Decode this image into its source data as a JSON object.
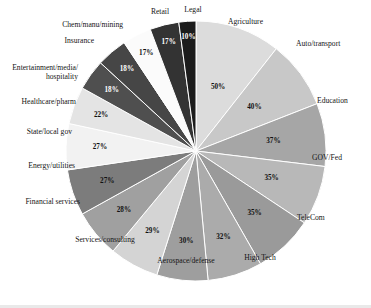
{
  "chart_data": {
    "type": "pie",
    "title": "",
    "subtitle": "",
    "xlabel": "",
    "ylabel": "",
    "legend_position": "none",
    "grid": false,
    "value_suffix": "%",
    "start_angle_deg": 0,
    "direction": "clockwise",
    "categories": [
      "Agriculture",
      "Auto/transport",
      "Education",
      "GOV/Fed",
      "TeleCom",
      "High Tech",
      "Aerospace/defense",
      "Services/consulting",
      "Financial services",
      "Energy/utilities",
      "State/local gov",
      "Healthcare/pharm",
      "Entertainment/media/ hospitality",
      "Insurance",
      "Chem/manu/mining",
      "Retail",
      "Legal"
    ],
    "values": [
      50,
      40,
      37,
      35,
      35,
      32,
      30,
      29,
      28,
      27,
      27,
      22,
      18,
      18,
      17,
      17,
      10
    ],
    "value_labels": [
      "50%",
      "40%",
      "37%",
      "35%",
      "35%",
      "32%",
      "30%",
      "29%",
      "28%",
      "27%",
      "27%",
      "22%",
      "18%",
      "18%",
      "17%",
      "17%",
      "10%"
    ],
    "colors": [
      "#dcdcdc",
      "#c8c8c8",
      "#a6a6a6",
      "#b8b8b8",
      "#9a9a9a",
      "#ababab",
      "#9e9e9e",
      "#d4d4d4",
      "#a0a0a0",
      "#7c7c7c",
      "#f2f2f2",
      "#e4e4e4",
      "#4f4f4f",
      "#464646",
      "#fbfbfb",
      "#333333",
      "#1c1c1c"
    ],
    "label_text_colors": [
      "dark",
      "dark",
      "dark",
      "dark",
      "dark",
      "dark",
      "dark",
      "dark",
      "dark",
      "dark",
      "dark",
      "dark",
      "light",
      "light",
      "dark",
      "light",
      "light"
    ],
    "slices": [
      {
        "name": "Agriculture",
        "value": 50,
        "label": "50%",
        "color": "#dcdcdc"
      },
      {
        "name": "Auto/transport",
        "value": 40,
        "label": "40%",
        "color": "#c8c8c8"
      },
      {
        "name": "Education",
        "value": 37,
        "label": "37%",
        "color": "#a6a6a6"
      },
      {
        "name": "GOV/Fed",
        "value": 35,
        "label": "35%",
        "color": "#b8b8b8"
      },
      {
        "name": "TeleCom",
        "value": 35,
        "label": "35%",
        "color": "#9a9a9a"
      },
      {
        "name": "High Tech",
        "value": 32,
        "label": "32%",
        "color": "#ababab"
      },
      {
        "name": "Aerospace/defense",
        "value": 30,
        "label": "30%",
        "color": "#9e9e9e"
      },
      {
        "name": "Services/consulting",
        "value": 29,
        "label": "29%",
        "color": "#d4d4d4"
      },
      {
        "name": "Financial services",
        "value": 28,
        "label": "28%",
        "color": "#a0a0a0"
      },
      {
        "name": "Energy/utilities",
        "value": 27,
        "label": "27%",
        "color": "#7c7c7c"
      },
      {
        "name": "State/local gov",
        "value": 27,
        "label": "27%",
        "color": "#f2f2f2"
      },
      {
        "name": "Healthcare/pharm",
        "value": 22,
        "label": "22%",
        "color": "#e4e4e4"
      },
      {
        "name": "Entertainment/media/ hospitality",
        "value": 18,
        "label": "18%",
        "color": "#4f4f4f"
      },
      {
        "name": "Insurance",
        "value": 18,
        "label": "18%",
        "color": "#464646"
      },
      {
        "name": "Chem/manu/mining",
        "value": 17,
        "label": "17%",
        "color": "#fbfbfb"
      },
      {
        "name": "Retail",
        "value": 17,
        "label": "17%",
        "color": "#333333"
      },
      {
        "name": "Legal",
        "value": 10,
        "label": "10%",
        "color": "#1c1c1c"
      }
    ],
    "total": 432
  },
  "style": {
    "background": "#ffffff",
    "slice_border": "#ffffff",
    "text_color": "#151515"
  }
}
